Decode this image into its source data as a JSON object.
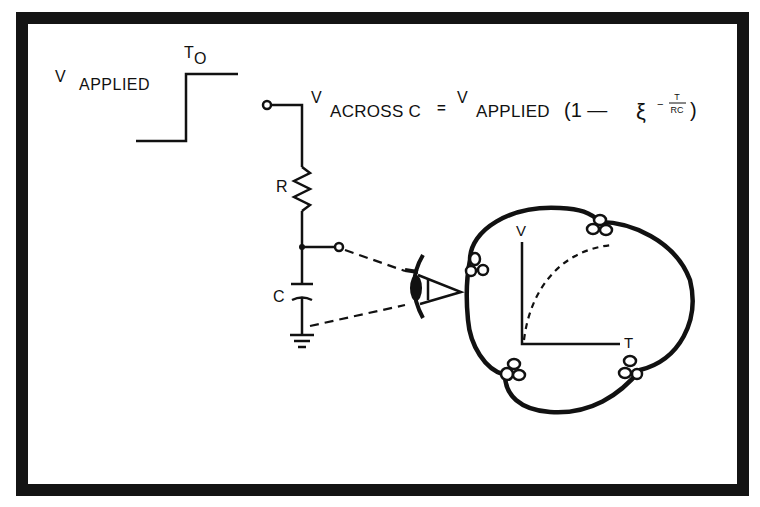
{
  "diagram": {
    "step_input": {
      "label_v": "V",
      "label_sub": "APPLIED",
      "time_label": "T",
      "time_sub": "O"
    },
    "equation": {
      "lhs_v": "V",
      "lhs_sub": "ACROSS C",
      "equals": "=",
      "rhs_v": "V",
      "rhs_sub": "APPLIED",
      "open_paren": "(1 —",
      "base": "ξ",
      "exp_sign": "−",
      "exp_num": "T",
      "exp_den": "RC",
      "close_paren": ")"
    },
    "components": {
      "resistor_label": "R",
      "capacitor_label": "C"
    },
    "scope_view": {
      "y_axis_label": "V",
      "x_axis_label": "T"
    },
    "colors": {
      "ink": "#111111",
      "background": "#ffffff",
      "frame": "#141414"
    }
  }
}
